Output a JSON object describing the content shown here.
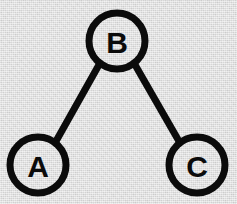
{
  "diagram": {
    "type": "node-link-diagram",
    "canvas": {
      "width": 237,
      "height": 204,
      "background_color": "#d9d9d9",
      "ink_color": "#0b0b0b"
    },
    "style": {
      "node_stroke_width": 7,
      "edge_stroke_width": 7,
      "node_radius": 28,
      "label_font_size": 30
    },
    "nodes": [
      {
        "id": "B",
        "label": "B",
        "cx": 117,
        "cy": 41,
        "r": 28,
        "role": "root"
      },
      {
        "id": "A",
        "label": "A",
        "cx": 38,
        "cy": 165,
        "r": 28,
        "role": "leaf"
      },
      {
        "id": "C",
        "label": "C",
        "cx": 197,
        "cy": 165,
        "r": 28,
        "role": "leaf"
      }
    ],
    "edges": [
      {
        "id": "edge-b-a",
        "from": "B",
        "to": "A",
        "x1": 100,
        "y1": 63,
        "x2": 55,
        "y2": 143
      },
      {
        "id": "edge-b-c",
        "from": "B",
        "to": "C",
        "x1": 134,
        "y1": 63,
        "x2": 180,
        "y2": 143
      }
    ]
  }
}
